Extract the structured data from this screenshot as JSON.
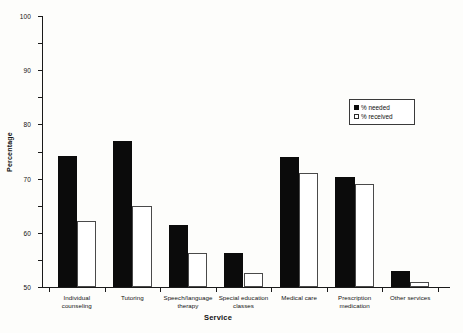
{
  "chart_data": {
    "type": "bar",
    "title": "",
    "xlabel": "Service",
    "ylabel": "Percentage",
    "ylim": [
      0,
      100
    ],
    "yticks": [
      0,
      10,
      20,
      30,
      40,
      50,
      60,
      70,
      80,
      90,
      100
    ],
    "grid": false,
    "legend_position": "upper right",
    "categories": [
      "Individual counseling",
      "Tutoring",
      "Speech/language therapy",
      "Special education classes",
      "Medical care",
      "Prescription medication",
      "Other services"
    ],
    "category_lines": [
      [
        "Individual",
        "counseling"
      ],
      [
        "Tutoring"
      ],
      [
        "Speech/language",
        "therapy"
      ],
      [
        "Special education",
        "classes"
      ],
      [
        "Medical care"
      ],
      [
        "Prescription",
        "medication"
      ],
      [
        "Other services"
      ]
    ],
    "series": [
      {
        "name": "% needed",
        "color": "#0b0b0b",
        "fill": "solid",
        "values": [
          48.5,
          54,
          23,
          12.5,
          48,
          40.5,
          6
        ]
      },
      {
        "name": "% received",
        "color": "#ffffff",
        "fill": "hollow",
        "values": [
          24.5,
          30,
          12.5,
          5,
          42,
          38,
          2
        ]
      }
    ]
  },
  "legend": {
    "items": [
      {
        "label": "% needed",
        "swatch": "filled-square-icon"
      },
      {
        "label": "% received",
        "swatch": "hollow-square-icon"
      }
    ]
  }
}
